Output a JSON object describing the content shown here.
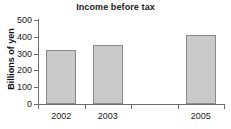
{
  "chart_data": {
    "type": "bar",
    "title": "Income before tax",
    "xlabel": "",
    "ylabel": "Billions of yen",
    "categories": [
      "2002",
      "2003",
      "2004",
      "2005"
    ],
    "values": [
      320,
      350,
      null,
      410
    ],
    "series": [
      {
        "name": "Income before tax",
        "values": [
          320,
          350,
          null,
          410
        ]
      }
    ],
    "ylim": [
      0,
      500
    ],
    "yticks": [
      0,
      100,
      200,
      300,
      400,
      500
    ],
    "ytick_labels": [
      "0",
      "100",
      "200",
      "300",
      "400",
      "500"
    ],
    "xtick_labels": [
      "2002",
      "2003",
      "",
      "2005"
    ],
    "grid": false,
    "legend": false,
    "legend_position": "none",
    "bar_fill_color": "#c9c9c9",
    "bar_edge_color": "#8a8a8a",
    "axis_color": "#6e6e6e",
    "text_color": "#1a1a1a",
    "background_color": "#ffffff"
  }
}
